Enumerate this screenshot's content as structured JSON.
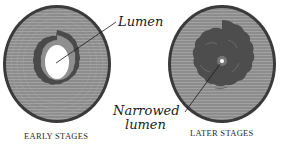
{
  "diagram": {
    "panels": [
      {
        "caption": "EARLY STAGES"
      },
      {
        "caption": "LATER STAGES"
      }
    ],
    "labels": {
      "lumen": "Lumen",
      "narrowed_line1": "Narrowed",
      "narrowed_line2": "lumen"
    },
    "colors": {
      "wall": "#8a8a8a",
      "outer_ring": "#3a3a3a",
      "plaque": "#555555",
      "lumen": "#ffffff"
    }
  }
}
